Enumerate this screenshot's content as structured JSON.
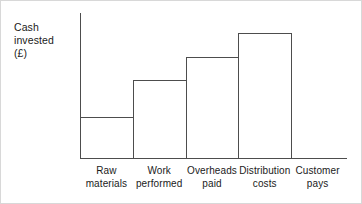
{
  "chart_data": {
    "type": "bar",
    "title": "",
    "subtitle": "",
    "ylabel": "Cash\ninvested\n(£)",
    "xlabel": "",
    "categories": [
      "Raw\nmaterials",
      "Work\nperformed",
      "Overheads\npaid",
      "Distribution\ncosts",
      "Customer\npays"
    ],
    "values": [
      28,
      47,
      60,
      73,
      0
    ],
    "value_note": "Cumulative cash invested rises in steps; the final category 'Customer pays' has no bar.",
    "ylim": [
      0,
      100
    ],
    "xlim_categories": 5,
    "grid": false,
    "legend": null,
    "axis_color": "#4d4d4d",
    "bar_fill": "none",
    "bar_edge_color": "#4d4d4d",
    "background": "#ffffff",
    "border_color": "#d8d8d8"
  },
  "geometry": {
    "plot_left": 79,
    "baseline_y": 157,
    "y_axis_top": 12,
    "x_axis_right": 346,
    "column_width": 52.8,
    "bar_tops": [
      116,
      79,
      56,
      32
    ],
    "bar_count": 4,
    "tick_positions": [
      79,
      131.8,
      184.6,
      237.4,
      290.2
    ]
  }
}
